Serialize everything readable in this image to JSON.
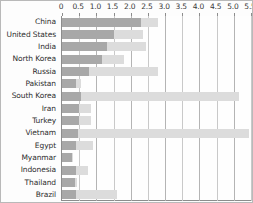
{
  "chart_data": {
    "type": "bar",
    "orientation": "horizontal",
    "title": "",
    "subtitle": "",
    "xlabel": "",
    "ylabel": "",
    "xlim": [
      0,
      5.5
    ],
    "grid": true,
    "legend_position": "none",
    "tick_labels": [
      "0",
      "0.5",
      "1.0",
      "1.5",
      "2.0",
      "2.5",
      "3.0",
      "3.5",
      "4.0",
      "4.5",
      "5.0",
      "5.5"
    ],
    "tick_values": [
      0,
      0.5,
      1.0,
      1.5,
      2.0,
      2.5,
      3.0,
      3.5,
      4.0,
      4.5,
      5.0,
      5.5
    ],
    "categories": [
      "China",
      "United States",
      "India",
      "North Korea",
      "Russia",
      "Pakistan",
      "South Korea",
      "Iran",
      "Turkey",
      "Vietnam",
      "Egypt",
      "Myanmar",
      "Indonesia",
      "Thailand",
      "Brazil"
    ],
    "series": [
      {
        "name": "dark-series",
        "color": "#a8a8a8",
        "values": [
          2.3,
          1.5,
          1.3,
          1.15,
          0.8,
          0.4,
          0.55,
          0.5,
          0.5,
          0.48,
          0.42,
          0.3,
          0.42,
          0.38,
          0.4
        ]
      },
      {
        "name": "light-series",
        "color": "#dcdcdc",
        "values": [
          2.8,
          2.35,
          2.45,
          1.8,
          2.8,
          0.55,
          5.15,
          0.85,
          0.85,
          5.45,
          0.9,
          0.32,
          0.75,
          0.45,
          1.6
        ]
      }
    ]
  },
  "colors": {
    "dark_bar": "#a8a8a8",
    "light_bar": "#dcdcdc",
    "gridline": "#c9c9c9",
    "axis": "#8d8d8d",
    "text": "#2e2e2e",
    "background": "#ffffff"
  }
}
